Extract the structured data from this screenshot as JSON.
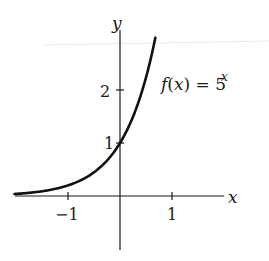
{
  "chart_data": {
    "type": "line",
    "title": "",
    "function_label": {
      "name": "f(x) = 5",
      "exponent": "x"
    },
    "xlabel": "x",
    "ylabel": "y",
    "xlim": [
      -2.0,
      2.1
    ],
    "ylim": [
      -0.9,
      3.0
    ],
    "x_ticks": [
      {
        "value": -1,
        "label": "−1"
      },
      {
        "value": 1,
        "label": "1"
      }
    ],
    "y_ticks": [
      {
        "value": 1,
        "label": "1"
      },
      {
        "value": 2,
        "label": "2"
      }
    ],
    "grid": false,
    "series": [
      {
        "name": "f(x) = 5^x",
        "x": [
          -2.0,
          -1.5,
          -1.0,
          -0.5,
          0.0,
          0.25,
          0.5,
          0.67
        ],
        "values": [
          0.04,
          0.089,
          0.2,
          0.447,
          1.0,
          1.495,
          2.236,
          2.94
        ]
      }
    ]
  },
  "labels": {
    "y_axis": "y",
    "x_axis": "x",
    "tick_y1": "1",
    "tick_y2": "2",
    "tick_xm1": "−1",
    "tick_x1": "1",
    "func_name": "f(x) = 5",
    "func_exp": "x"
  }
}
